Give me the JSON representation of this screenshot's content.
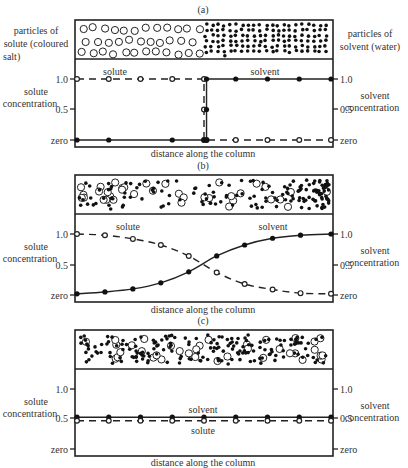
{
  "figure": {
    "panels": [
      {
        "id": "a",
        "label": "(a)",
        "top_left_label": [
          "particles of",
          "solute (coloured",
          "salt)"
        ],
        "top_right_label": [
          "particles of",
          "solvent (water)"
        ],
        "left_axis_label": [
          "solute",
          "concentration"
        ],
        "right_axis_label": [
          "solvent",
          "concentration"
        ],
        "x_label": "distance along the column",
        "series_labels": {
          "solute": "solute",
          "solvent": "solvent"
        }
      },
      {
        "id": "b",
        "label": "(b)",
        "left_axis_label": [
          "solute",
          "concentration"
        ],
        "right_axis_label": [
          "solvent",
          "concentration"
        ],
        "x_label": "distance along the column",
        "series_labels": {
          "solute": "solute",
          "solvent": "solvent"
        }
      },
      {
        "id": "c",
        "label": "(c)",
        "left_axis_label": [
          "solute",
          "concentration"
        ],
        "right_axis_label": [
          "solvent",
          "concentration"
        ],
        "x_label": "distance along the column",
        "series_labels": {
          "solute": "solute",
          "solvent": "solvent"
        }
      }
    ],
    "tick_labels": [
      "1.0",
      "0.5",
      "zero"
    ]
  },
  "chart_data": [
    {
      "type": "line",
      "title": "(a)",
      "xlabel": "distance along the column",
      "ylabel_left": "solute concentration",
      "ylabel_right": "solvent concentration",
      "yticks": [
        "zero",
        "0.5",
        "1.0"
      ],
      "ylim": [
        0,
        1
      ],
      "series": [
        {
          "name": "solute",
          "style": "dashed-open-circles",
          "x": [
            0,
            0.125,
            0.25,
            0.375,
            0.5,
            0.5,
            0.5,
            0.51,
            0.625,
            0.75,
            0.875,
            1.0
          ],
          "values": [
            1.0,
            1.0,
            1.0,
            1.0,
            1.0,
            0.5,
            0,
            0,
            0,
            0,
            0,
            0
          ]
        },
        {
          "name": "solvent",
          "style": "solid-filled-circles",
          "x": [
            0,
            0.125,
            0.375,
            0.5,
            0.51,
            0.51,
            0.51,
            0.625,
            0.75,
            0.875,
            1.0
          ],
          "values": [
            0,
            0,
            0,
            0,
            0,
            0.5,
            1.0,
            1.0,
            1.0,
            1.0,
            1.0
          ]
        }
      ]
    },
    {
      "type": "line",
      "title": "(b)",
      "xlabel": "distance along the column",
      "ylabel_left": "solute concentration",
      "ylabel_right": "solvent concentration",
      "yticks": [
        "zero",
        "0.5",
        "1.0"
      ],
      "ylim": [
        0,
        1
      ],
      "series": [
        {
          "name": "solute",
          "style": "dashed-open-circles",
          "x": [
            0,
            0.11,
            0.22,
            0.33,
            0.44,
            0.55,
            0.66,
            0.77,
            0.88,
            1.0
          ],
          "values": [
            1.0,
            0.98,
            0.92,
            0.82,
            0.64,
            0.37,
            0.18,
            0.09,
            0.03,
            0.02
          ]
        },
        {
          "name": "solvent",
          "style": "solid-filled-circles",
          "x": [
            0,
            0.11,
            0.22,
            0.33,
            0.44,
            0.55,
            0.66,
            0.77,
            0.88,
            1.0
          ],
          "values": [
            0.02,
            0.05,
            0.1,
            0.2,
            0.38,
            0.64,
            0.82,
            0.93,
            0.98,
            1.0
          ]
        }
      ]
    },
    {
      "type": "line",
      "title": "(c)",
      "xlabel": "distance along the column",
      "ylabel_left": "solute concentration",
      "ylabel_right": "solvent concentration",
      "yticks": [
        "zero",
        "0.5",
        "1.0"
      ],
      "ylim": [
        0,
        1
      ],
      "series": [
        {
          "name": "solvent",
          "style": "solid-filled-circles",
          "x": [
            0,
            0.125,
            0.25,
            0.375,
            0.5,
            0.625,
            0.75,
            0.875,
            1.0
          ],
          "values": [
            0.53,
            0.53,
            0.53,
            0.53,
            0.53,
            0.53,
            0.53,
            0.53,
            0.53
          ]
        },
        {
          "name": "solute",
          "style": "dashed-open-circles",
          "x": [
            0,
            0.125,
            0.25,
            0.375,
            0.5,
            0.625,
            0.75,
            0.875,
            1.0
          ],
          "values": [
            0.47,
            0.47,
            0.47,
            0.47,
            0.47,
            0.47,
            0.47,
            0.47,
            0.47
          ]
        }
      ]
    }
  ]
}
